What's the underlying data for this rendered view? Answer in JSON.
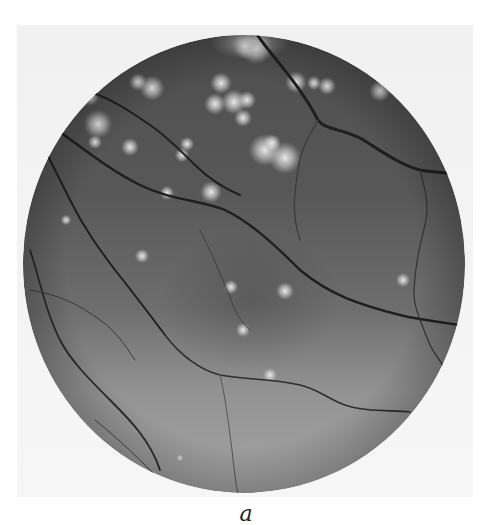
{
  "figure": {
    "panel_label": "a",
    "image_kind": "grayscale fundus photograph",
    "colors": {
      "background": "#ffffff",
      "panel": "#f3f3f3",
      "retina_upper": "#545454",
      "retina_lower": "#a0a0a0",
      "vessel": "#1e1e1e",
      "exudate": "#e8e8e8"
    },
    "fundus": {
      "cx": 244,
      "cy": 264,
      "rx": 221,
      "ry": 229
    },
    "exudates": [
      [
        98,
        124,
        8
      ],
      [
        130,
        147,
        5
      ],
      [
        152,
        88,
        7
      ],
      [
        138,
        82,
        5
      ],
      [
        221,
        83,
        6
      ],
      [
        215,
        104,
        6
      ],
      [
        234,
        102,
        7
      ],
      [
        247,
        100,
        5
      ],
      [
        243,
        118,
        5
      ],
      [
        265,
        150,
        9
      ],
      [
        285,
        158,
        9
      ],
      [
        272,
        143,
        5
      ],
      [
        296,
        82,
        6
      ],
      [
        327,
        86,
        5
      ],
      [
        314,
        83,
        4
      ],
      [
        380,
        91,
        6
      ],
      [
        256,
        48,
        9
      ],
      [
        245,
        46,
        7
      ],
      [
        187,
        144,
        4
      ],
      [
        182,
        155,
        4
      ],
      [
        90,
        97,
        5
      ],
      [
        95,
        142,
        4
      ],
      [
        211,
        192,
        6
      ],
      [
        167,
        193,
        4
      ],
      [
        142,
        256,
        4
      ],
      [
        285,
        291,
        5
      ],
      [
        231,
        287,
        4
      ],
      [
        243,
        330,
        4
      ],
      [
        403,
        280,
        4
      ],
      [
        66,
        220,
        3
      ],
      [
        180,
        458,
        2
      ],
      [
        270,
        375,
        4
      ]
    ]
  }
}
